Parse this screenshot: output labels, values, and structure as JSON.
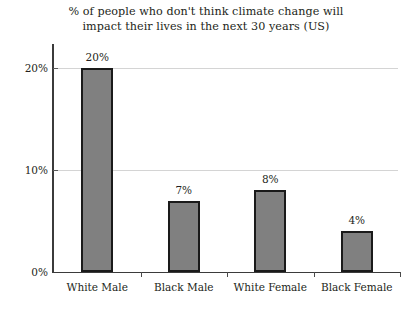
{
  "chart_data": {
    "type": "bar",
    "title": "% of people who don't think climate change will impact their lives in the next 30 years (US)",
    "title_lines": [
      "% of people who don't think climate change will",
      "impact their lives in the next 30 years (US)"
    ],
    "categories": [
      "White Male",
      "Black Male",
      "White Female",
      "Black Female"
    ],
    "values": [
      20,
      7,
      8,
      4
    ],
    "value_labels": [
      "20%",
      "7%",
      "8%",
      "4%"
    ],
    "xlabel": "",
    "ylabel": "",
    "ylim": [
      0,
      22.5
    ],
    "yticks": [
      0,
      10,
      20
    ],
    "ytick_labels": [
      "0%",
      "10%",
      "20%"
    ],
    "grid": true,
    "grid_axis": "y",
    "legend": false,
    "bar_color": "#808080",
    "bar_edge_color": "#1a1a1a",
    "gridline_color": "#d4d4d4",
    "axis_color": "#3b3b3b",
    "text_color": "#231f20",
    "background": "#ffffff"
  }
}
